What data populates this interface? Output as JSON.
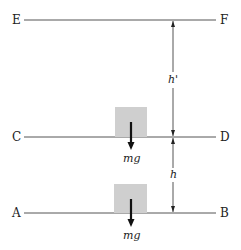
{
  "levels": [
    {
      "left": "E",
      "right": "F",
      "y": 20
    },
    {
      "left": "C",
      "right": "D",
      "y": 137
    },
    {
      "left": "A",
      "right": "B",
      "y": 213
    }
  ],
  "blocks": [
    {
      "force_label": "mg",
      "level": "CD"
    },
    {
      "force_label": "mg",
      "level": "AB"
    }
  ],
  "heights": [
    {
      "label": "h'",
      "from": "CD",
      "to": "EF"
    },
    {
      "label": "h",
      "from": "AB",
      "to": "CD"
    }
  ],
  "colors": {
    "block": "#cfcfcf",
    "line": "#444444",
    "arrow": "#111111"
  }
}
